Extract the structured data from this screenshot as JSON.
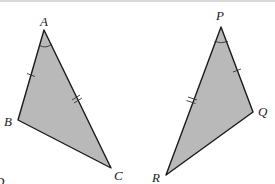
{
  "figure": {
    "fill_color": "#b9b9b9",
    "stroke_color": "#1a1a1a"
  },
  "triangles": [
    {
      "name": "ABC",
      "vertices": [
        {
          "label": "A",
          "x": 44,
          "y": 30,
          "lx": 40,
          "ly": 26
        },
        {
          "label": "B",
          "x": 18,
          "y": 120,
          "lx": 4,
          "ly": 126
        },
        {
          "label": "C",
          "x": 111,
          "y": 168,
          "lx": 114,
          "ly": 180
        }
      ],
      "marks": {
        "single_tick_side": "AB",
        "double_tick_side": "AC",
        "angle_arc_vertex": "A"
      }
    },
    {
      "name": "PQR",
      "vertices": [
        {
          "label": "P",
          "x": 221,
          "y": 27,
          "lx": 216,
          "ly": 20
        },
        {
          "label": "Q",
          "x": 253,
          "y": 112,
          "lx": 258,
          "ly": 116
        },
        {
          "label": "R",
          "x": 166,
          "y": 175,
          "lx": 152,
          "ly": 182
        }
      ],
      "marks": {
        "single_tick_side": "PQ",
        "double_tick_side": "PR",
        "angle_arc_vertex": "P"
      }
    }
  ],
  "stray_text": "D"
}
